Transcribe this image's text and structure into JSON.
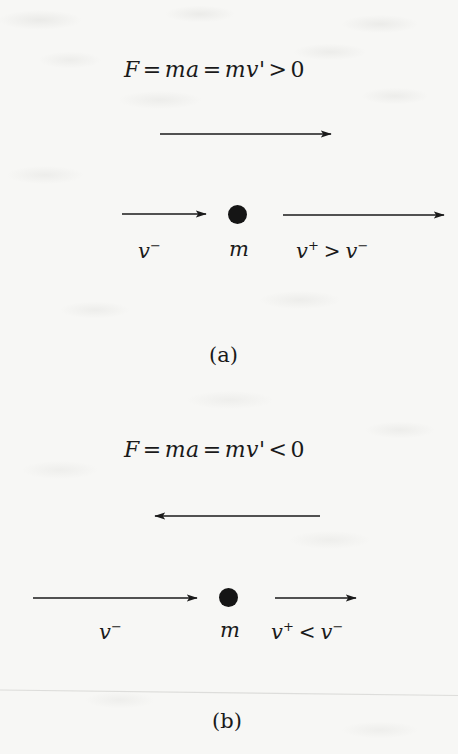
{
  "figure": {
    "background_color": "#f7f7f5",
    "ink_color": "#1a1a1a",
    "width": 458,
    "height": 754
  },
  "panels": [
    {
      "id": "a",
      "caption": "(a)",
      "equation": {
        "full": "F = ma = mv' > 0",
        "force_symbol": "F",
        "first_equals": "=",
        "mass_times_accel": "ma",
        "second_equals": "=",
        "mass_times_vprime": "mv'",
        "relation": ">",
        "value": "0"
      },
      "force_arrow": {
        "name": "force-arrow",
        "direction": "right",
        "x1": 160,
        "x2": 331,
        "y": 134
      },
      "mass": {
        "label": "m",
        "cx": 237,
        "cy": 214,
        "diameter": 19
      },
      "velocity_before": {
        "label_text": "v",
        "label_sup": "−",
        "arrow_direction": "right",
        "arrow_x1": 122,
        "arrow_x2": 206,
        "arrow_y": 214,
        "label_cx": 152,
        "label_cy": 252
      },
      "velocity_after": {
        "label_text": "v",
        "label_sup": "+",
        "relation": ">",
        "compare_text": "v",
        "compare_sup": "−",
        "arrow_direction": "right",
        "arrow_x1": 283,
        "arrow_x2": 444,
        "arrow_y": 215,
        "label_cx": 345,
        "label_cy": 253
      },
      "caption_cx": 228,
      "caption_cy": 356
    },
    {
      "id": "b",
      "caption": "(b)",
      "equation": {
        "full": "F = ma = mv' < 0",
        "force_symbol": "F",
        "first_equals": "=",
        "mass_times_accel": "ma",
        "second_equals": "=",
        "mass_times_vprime": "mv'",
        "relation": "<",
        "value": "0"
      },
      "force_arrow": {
        "name": "force-arrow",
        "direction": "left",
        "x1": 320,
        "x2": 155,
        "y": 516
      },
      "mass": {
        "label": "m",
        "cx": 228,
        "cy": 597,
        "diameter": 19
      },
      "velocity_before": {
        "label_text": "v",
        "label_sup": "−",
        "arrow_direction": "right",
        "arrow_x1": 33,
        "arrow_x2": 197,
        "arrow_y": 598,
        "label_cx": 113,
        "label_cy": 633
      },
      "velocity_after": {
        "label_text": "v",
        "label_sup": "+",
        "relation": "<",
        "compare_text": "v",
        "compare_sup": "−",
        "arrow_direction": "right",
        "arrow_x1": 275,
        "arrow_x2": 356,
        "arrow_y": 598,
        "label_cx": 320,
        "label_cy": 633
      },
      "caption_cx": 231,
      "caption_cy": 722
    }
  ],
  "equation_positions": [
    {
      "cx": 229,
      "cy": 70
    },
    {
      "cx": 229,
      "cy": 450
    }
  ],
  "divider": {
    "name": "page-edge-rule",
    "visible": true,
    "y": 692
  }
}
